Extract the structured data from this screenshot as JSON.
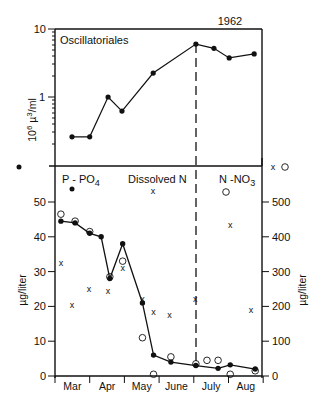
{
  "chart_data": [
    {
      "type": "line",
      "title": "Oscillatoriales",
      "annotation": "1962",
      "xlabel": "",
      "ylabel": "10^6 µ^3/ml",
      "yscale": "log",
      "ylim": [
        0.1,
        10
      ],
      "y_ticks": [
        "10",
        "1"
      ],
      "x_unit": "months since Mar 1",
      "series": [
        {
          "name": "Oscillatoriales",
          "marker": "filled-circle",
          "line": true,
          "x": [
            0.49,
            1.0,
            1.53,
            1.93,
            2.83,
            4.06,
            4.58,
            5.02,
            5.74
          ],
          "values": [
            0.26,
            0.26,
            1.0,
            0.62,
            2.25,
            6.0,
            5.2,
            3.75,
            4.3
          ]
        }
      ],
      "vline": {
        "x": 4.06,
        "style": "dashed"
      }
    },
    {
      "type": "scatter",
      "title": "",
      "xlabel": "",
      "x_categories": [
        "Mar",
        "Apr",
        "May",
        "June",
        "July",
        "Aug"
      ],
      "ylabel_left": "µg/liter",
      "ylabel_right": "µg/liter",
      "ylim_left": [
        0,
        60
      ],
      "ylim_right": [
        0,
        600
      ],
      "y_ticks_left": [
        "0",
        "10",
        "20",
        "30",
        "40",
        "50"
      ],
      "y_ticks_right": [
        "0",
        "100",
        "200",
        "300",
        "400",
        "500"
      ],
      "legend": [
        {
          "label": "P - PO4",
          "marker": "filled-circle",
          "axis": "left"
        },
        {
          "label": "Dissolved N",
          "marker": "x",
          "axis": "right"
        },
        {
          "label": "N -NO3",
          "marker": "open-circle",
          "axis": "right"
        }
      ],
      "series": [
        {
          "name": "P - PO4",
          "marker": "filled-circle",
          "line": true,
          "axis": "left",
          "x": [
            0.17,
            0.58,
            1.0,
            1.33,
            1.58,
            1.95,
            2.52,
            2.84,
            3.34,
            4.06,
            4.7,
            5.05,
            5.77
          ],
          "values": [
            44.5,
            44,
            41,
            40,
            28,
            38,
            21,
            6,
            4,
            3,
            2.2,
            3.2,
            2
          ]
        },
        {
          "name": "Dissolved N",
          "marker": "x",
          "line": false,
          "axis": "right",
          "x": [
            0.17,
            0.49,
            0.98,
            1.53,
            1.95,
            2.52,
            2.84,
            3.3,
            4.04,
            5.05,
            5.65
          ],
          "values": [
            325,
            205,
            250,
            245,
            310,
            220,
            185,
            175,
            220,
            435,
            190
          ]
        },
        {
          "name": "N -NO3",
          "marker": "open-circle",
          "line": false,
          "axis": "right",
          "x": [
            0.17,
            0.58,
            1.0,
            1.58,
            1.95,
            2.52,
            2.84,
            3.34,
            4.06,
            4.38,
            4.7,
            5.05,
            5.77
          ],
          "values": [
            465,
            445,
            415,
            285,
            330,
            110,
            5,
            55,
            35,
            45,
            45,
            5,
            15
          ]
        }
      ],
      "vline": {
        "x": 4.06,
        "style": "dashed"
      },
      "annotation_points": [
        {
          "label": "data point above axis top (P - PO4)",
          "marker": "filled-circle",
          "side": "left"
        },
        {
          "label": "data points above axis top (Dissolved N, N -NO3)",
          "markers": [
            "x",
            "open-circle"
          ],
          "side": "right"
        }
      ]
    }
  ],
  "labels": {
    "year": "1962",
    "upper_title": "Oscillatoriales",
    "upper_ylabel_main": "10",
    "upper_ylabel_sup": "6",
    "upper_ylabel_unit": " µ",
    "upper_ylabel_unit_sup": "3",
    "upper_ylabel_unit_rest": "/ml",
    "upper_tick_10": "10",
    "upper_tick_1": "1",
    "legend_p": "P - PO",
    "legend_p_sub": "4",
    "legend_dn": "Dissolved N",
    "legend_no3": "N -NO",
    "legend_no3_sub": "3",
    "left_ylabel": "µg/liter",
    "right_ylabel": "µg/liter",
    "x_mark": "x"
  }
}
